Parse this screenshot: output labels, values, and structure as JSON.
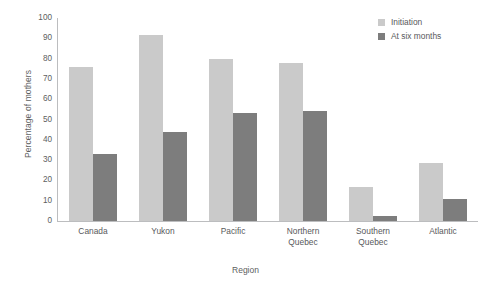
{
  "chart_data": {
    "type": "bar",
    "title": "",
    "subtitle": "",
    "xlabel": "Region",
    "ylabel": "Percentage of mothers",
    "ylim": [
      0,
      100
    ],
    "yticks": [
      0,
      10,
      20,
      30,
      40,
      50,
      60,
      70,
      80,
      90,
      100
    ],
    "ytick_labels": [
      "0",
      "10",
      "20",
      "30",
      "40",
      "50",
      "60",
      "70",
      "80",
      "90",
      "100"
    ],
    "grid": false,
    "legend_position": "top-right",
    "categories": [
      "Canada",
      "Yukon",
      "Pacific",
      "Northern Quebec",
      "Southern Quebec",
      "Atlantic"
    ],
    "category_display": [
      "Canada",
      "Yukon",
      "Pacific",
      "Northern\nQuebec",
      "Southern\nQuebec",
      "Atlantic"
    ],
    "series": [
      {
        "name": "Initiation",
        "color": "#cacaca",
        "values": [
          76,
          91.5,
          80,
          78,
          17,
          28.5
        ]
      },
      {
        "name": "At six months",
        "color": "#7d7d7d",
        "values": [
          33,
          44,
          53,
          54,
          2.5,
          11
        ]
      }
    ],
    "axis_color": "#bcbdbf",
    "text_color": "#58595b",
    "background": "#ffffff"
  }
}
